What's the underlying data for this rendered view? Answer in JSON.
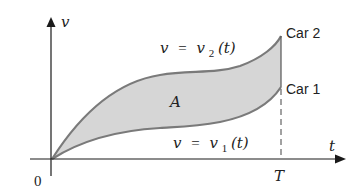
{
  "diagram": {
    "axes": {
      "y_label": "v",
      "x_label": "t",
      "origin_label": "0",
      "t_marker_label": "T"
    },
    "curves": {
      "upper": {
        "label_lhs": "v",
        "label_eq": "=",
        "label_fn": "v",
        "label_sub": "2",
        "label_arg": "(t)",
        "end_label": "Car 2"
      },
      "lower": {
        "label_lhs": "v",
        "label_eq": "=",
        "label_fn": "v",
        "label_sub": "1",
        "label_arg": "(t)",
        "end_label": "Car 1"
      }
    },
    "region_label": "A",
    "colors": {
      "fill": "#d6d6d6",
      "curve": "#7a7a7a",
      "axis": "#1a1a1a"
    }
  }
}
